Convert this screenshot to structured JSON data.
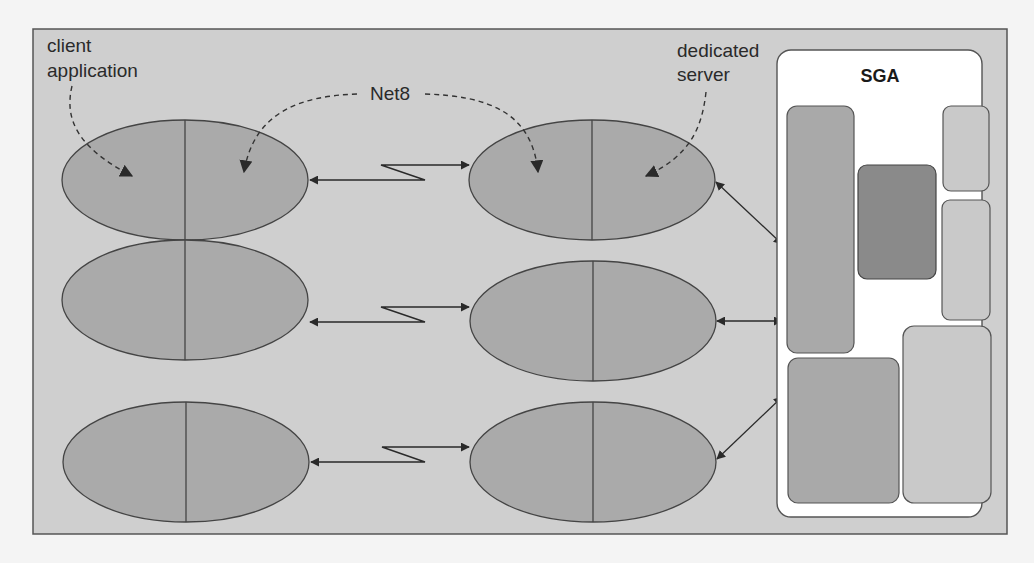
{
  "diagram": {
    "labels": {
      "client_line1": "client",
      "client_line2": "application",
      "net8": "Net8",
      "server_line1": "dedicated",
      "server_line2": "server",
      "sga": "SGA"
    },
    "colors": {
      "frame_bg": "#cfcfcf",
      "frame_border": "#555555",
      "ellipse_fill": "#aaaaaa",
      "ellipse_stroke": "#444444",
      "sga_bg": "#ffffff",
      "block_medium": "#a9a9a9",
      "block_dark": "#8a8a8a",
      "block_light": "#c9c9c9",
      "arrow": "#2a2a2a"
    },
    "rows": [
      {
        "client": "client-process-1",
        "server": "server-process-1"
      },
      {
        "client": "client-process-2",
        "server": "server-process-2"
      },
      {
        "client": "client-process-3",
        "server": "server-process-3"
      }
    ],
    "sga_blocks": [
      {
        "name": "sga-block-tall-left",
        "shade": "medium"
      },
      {
        "name": "sga-block-dark-center",
        "shade": "dark"
      },
      {
        "name": "sga-block-small-top-right",
        "shade": "light"
      },
      {
        "name": "sga-block-mid-right",
        "shade": "light"
      },
      {
        "name": "sga-block-bottom-left",
        "shade": "medium"
      },
      {
        "name": "sga-block-bottom-right",
        "shade": "light"
      }
    ]
  }
}
